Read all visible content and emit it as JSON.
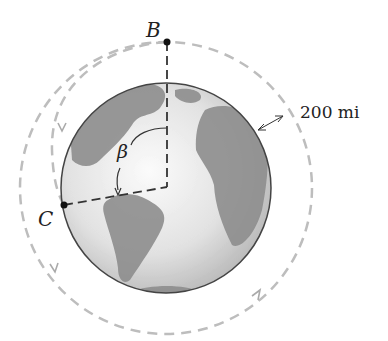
{
  "figure": {
    "labels": {
      "point_b": "B",
      "point_c": "C",
      "angle": "β",
      "altitude": "200 mi"
    },
    "colors": {
      "orbit_dash": "#b8b8b8",
      "line": "#333333",
      "globe_ocean": "#e6e6e6",
      "globe_land": "#8c8c8c",
      "outline": "#444444"
    },
    "geometry": {
      "globe_center": [
        166,
        188
      ],
      "globe_radius": 105,
      "orbit_radius": 146
    }
  }
}
